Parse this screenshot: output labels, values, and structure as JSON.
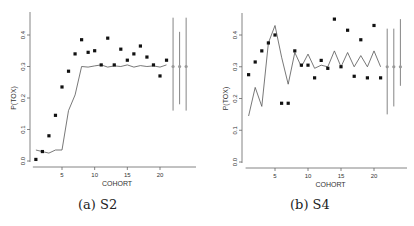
{
  "captions": {
    "a": "(a) S2",
    "b": "(b) S4"
  },
  "chart_data": [
    {
      "type": "scatter",
      "panel": "a",
      "caption": "(a) S2",
      "xlabel": "COHORT",
      "ylabel": "P(TOX)",
      "xticks": [
        5,
        10,
        15,
        20
      ],
      "yticks": [
        0.0,
        0.1,
        0.2,
        0.3,
        0.4
      ],
      "ytick_labels": [
        "0.0",
        "0.1",
        "0.2",
        "0.3",
        "0.4"
      ],
      "ylim": [
        0.0,
        0.45
      ],
      "xlim": [
        0.5,
        25
      ],
      "grid": false,
      "series": [
        {
          "name": "observed",
          "style": "points",
          "x": [
            1,
            2,
            3,
            4,
            5,
            6,
            7,
            8,
            9,
            10,
            11,
            12,
            13,
            14,
            15,
            16,
            17,
            18,
            19,
            20,
            21
          ],
          "y": [
            0.005,
            0.03,
            0.08,
            0.145,
            0.235,
            0.285,
            0.34,
            0.385,
            0.345,
            0.35,
            0.305,
            0.39,
            0.305,
            0.355,
            0.32,
            0.34,
            0.365,
            0.33,
            0.305,
            0.27,
            0.32
          ]
        },
        {
          "name": "estimate",
          "style": "line",
          "x": [
            1,
            2,
            3,
            4,
            5,
            6,
            7,
            8,
            9,
            10,
            11,
            12,
            13,
            14,
            15,
            16,
            17,
            18,
            19,
            20,
            21
          ],
          "y": [
            0.035,
            0.03,
            0.025,
            0.035,
            0.035,
            0.16,
            0.21,
            0.3,
            0.298,
            0.302,
            0.305,
            0.298,
            0.302,
            0.3,
            0.305,
            0.298,
            0.303,
            0.3,
            0.302,
            0.298,
            0.305
          ]
        }
      ],
      "intervals": [
        {
          "x": 22,
          "center": 0.3,
          "low": 0.16,
          "high": 0.455
        },
        {
          "x": 23,
          "center": 0.3,
          "low": 0.18,
          "high": 0.41
        },
        {
          "x": 24,
          "center": 0.3,
          "low": 0.16,
          "high": 0.455
        }
      ]
    },
    {
      "type": "scatter",
      "panel": "b",
      "caption": "(b) S4",
      "xlabel": "COHORT",
      "ylabel": "P(TOX)",
      "xticks": [
        5,
        10,
        15,
        20
      ],
      "yticks": [
        0.0,
        0.1,
        0.2,
        0.3,
        0.4
      ],
      "ytick_labels": [
        "0.0",
        "0.1",
        "0.2",
        "0.3",
        "0.4"
      ],
      "ylim": [
        0.0,
        0.45
      ],
      "xlim": [
        0.5,
        25
      ],
      "grid": false,
      "series": [
        {
          "name": "observed",
          "style": "points",
          "x": [
            1,
            2,
            3,
            4,
            5,
            6,
            7,
            8,
            9,
            10,
            11,
            12,
            13,
            14,
            15,
            16,
            17,
            18,
            19,
            20,
            21
          ],
          "y": [
            0.275,
            0.315,
            0.35,
            0.375,
            0.4,
            0.185,
            0.185,
            0.35,
            0.305,
            0.305,
            0.265,
            0.32,
            0.295,
            0.45,
            0.3,
            0.415,
            0.27,
            0.385,
            0.265,
            0.43,
            0.265
          ]
        },
        {
          "name": "estimate",
          "style": "line",
          "x": [
            1,
            2,
            3,
            4,
            5,
            6,
            7,
            8,
            9,
            10,
            11,
            12,
            13,
            14,
            15,
            16,
            17,
            18,
            19,
            20,
            21
          ],
          "y": [
            0.145,
            0.235,
            0.175,
            0.375,
            0.43,
            0.33,
            0.245,
            0.345,
            0.3,
            0.34,
            0.295,
            0.305,
            0.3,
            0.35,
            0.3,
            0.345,
            0.3,
            0.335,
            0.3,
            0.35,
            0.3
          ]
        }
      ],
      "intervals": [
        {
          "x": 22,
          "center": 0.3,
          "low": 0.15,
          "high": 0.42
        },
        {
          "x": 23,
          "center": 0.3,
          "low": 0.175,
          "high": 0.42
        },
        {
          "x": 24,
          "center": 0.3,
          "low": 0.24,
          "high": 0.45
        }
      ]
    }
  ]
}
